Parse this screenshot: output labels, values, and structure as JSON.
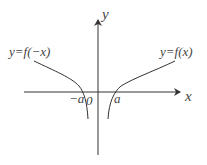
{
  "diagram": {
    "axes": {
      "x_label": "x",
      "y_label": "y",
      "origin_label": "0"
    },
    "ticks": {
      "neg_a": "−a",
      "pos_a": "a"
    },
    "curves": [
      {
        "label": "y=f(−x)",
        "side": "left"
      },
      {
        "label": "y=f(x)",
        "side": "right"
      }
    ],
    "colors": {
      "stroke": "#333333",
      "text": "#444444"
    }
  }
}
